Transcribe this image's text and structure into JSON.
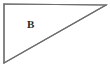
{
  "figure": {
    "name": "right-triangle-diagram",
    "background_color": "#ffffff",
    "stroke_color": "#6e6e6e",
    "stroke_width": 1.2,
    "canvas": {
      "width": 110,
      "height": 83
    },
    "labels": [
      {
        "id": "B",
        "text": "B",
        "x": 31,
        "y": 25,
        "color": "#2b2b2b",
        "font_size": 11,
        "font_weight": "bold"
      }
    ],
    "shape": {
      "type": "triangle",
      "right_angle_at": "top-left",
      "vertices": [
        {
          "name": "top-left",
          "x": 4,
          "y": 4
        },
        {
          "name": "top-right",
          "x": 106,
          "y": 5
        },
        {
          "name": "bottom-left",
          "x": 4,
          "y": 63
        }
      ],
      "edges": [
        {
          "name": "top-edge",
          "from": "top-left",
          "to": "top-right"
        },
        {
          "name": "left-edge",
          "from": "top-left",
          "to": "bottom-left"
        },
        {
          "name": "hypotenuse",
          "from": "bottom-left",
          "to": "top-right"
        }
      ],
      "points_path": "4,4 106,5 4,63"
    }
  }
}
